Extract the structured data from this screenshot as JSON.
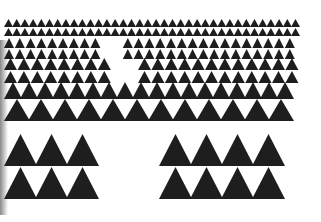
{
  "image": {
    "description": "Scanned print of a black triangle tessellation pattern, rows of upward triangles growing in size from top to bottom",
    "background": "#ffffff",
    "ink_color": "#1e1e1e",
    "right_edge": 304,
    "left_edge": 4
  },
  "rows": [
    {
      "y": 19,
      "h": 8,
      "w": 9,
      "step": 8.2,
      "gap": null
    },
    {
      "y": 28,
      "h": 8,
      "w": 9,
      "step": 8.2,
      "gap": null
    },
    {
      "y": 38,
      "h": 10,
      "w": 10,
      "step": 10.8,
      "gap": [
        110,
        121
      ]
    },
    {
      "y": 49,
      "h": 10,
      "w": 10,
      "step": 10.8,
      "gap": [
        110,
        121
      ]
    },
    {
      "y": 58,
      "h": 12,
      "w": 13,
      "step": 13.4,
      "gap": [
        112,
        130
      ]
    },
    {
      "y": 71,
      "h": 12,
      "w": 13,
      "step": 13.4,
      "gap": [
        112,
        130
      ]
    },
    {
      "y": 82,
      "h": 17,
      "w": 18,
      "step": 16.0,
      "gap": null
    },
    {
      "y": 99,
      "h": 22,
      "w": 26,
      "step": 24.0,
      "gap": null
    },
    {
      "y": 134,
      "h": 32,
      "w": 33,
      "step": 31.0,
      "gap": [
        124,
        144
      ]
    },
    {
      "y": 167,
      "h": 32,
      "w": 33,
      "step": 31.0,
      "gap": [
        124,
        144
      ]
    }
  ]
}
